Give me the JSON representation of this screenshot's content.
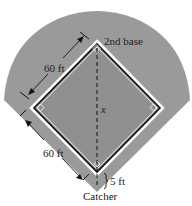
{
  "diagram": {
    "labels": {
      "second_base": "2nd base",
      "side_upper": "60 ft",
      "side_lower": "60 ft",
      "diagonal": "x",
      "offset": "5 ft",
      "catcher": "Catcher"
    },
    "colors": {
      "field": "#9a9a9a",
      "infield": "#8f8f8f",
      "baseline": "#111111",
      "outline": "#ffffff",
      "text": "#222222"
    }
  }
}
